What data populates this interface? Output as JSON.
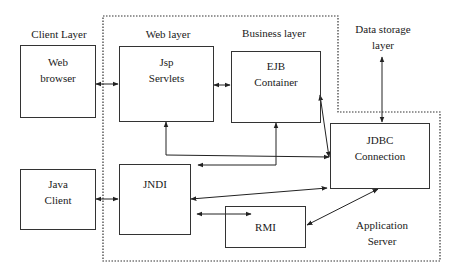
{
  "layers": {
    "client": "Client Layer",
    "web": "Web layer",
    "business": "Business layer",
    "data_storage_line1": "Data storage",
    "data_storage_line2": "layer",
    "app_server_line1": "Application",
    "app_server_line2": "Server"
  },
  "boxes": {
    "web_browser": {
      "line1": "Web",
      "line2": "browser"
    },
    "jsp_servlets": {
      "line1": "Jsp",
      "line2": "Servlets"
    },
    "ejb_container": {
      "line1": "EJB",
      "line2": "Container"
    },
    "jdbc_connection": {
      "line1": "JDBC",
      "line2": "Connection"
    },
    "java_client": {
      "line1": "Java",
      "line2": "Client"
    },
    "jndi": {
      "line1": "JNDI"
    },
    "rmi": {
      "line1": "RMI"
    }
  },
  "colors": {
    "stroke": "#333333",
    "background": "#ffffff"
  }
}
